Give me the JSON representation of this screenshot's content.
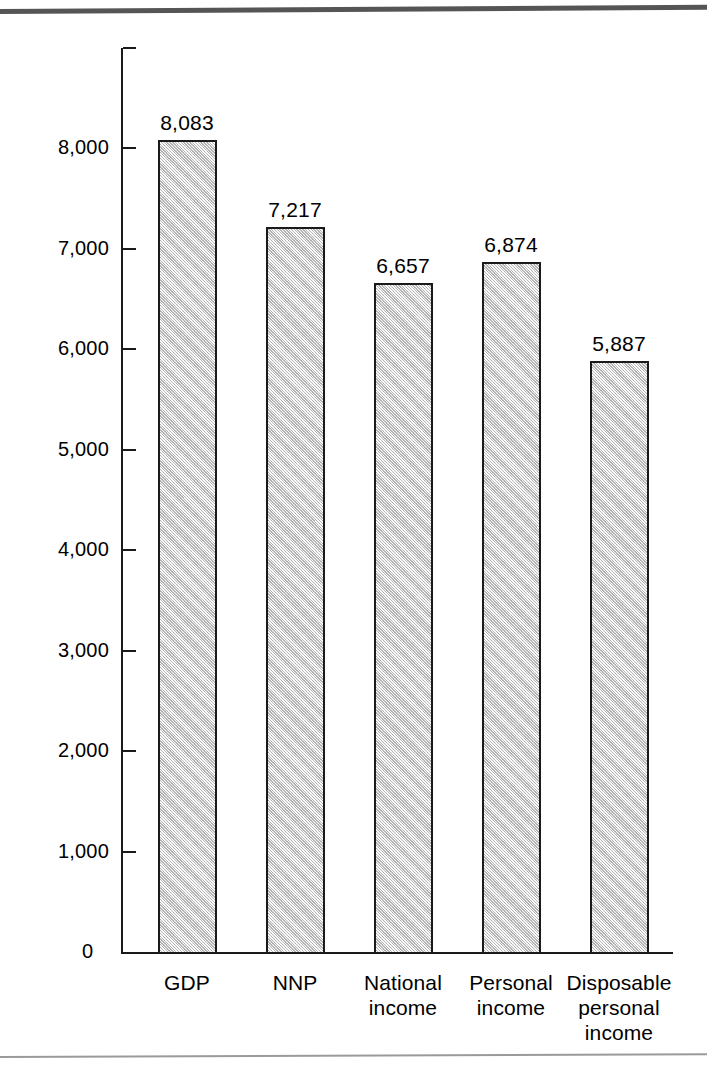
{
  "chart_data": {
    "type": "bar",
    "title": "",
    "subtitle": "",
    "xlabel": "",
    "ylabel": "",
    "categories": [
      "GDP",
      "National\nincome",
      "NNP",
      "Personal\nincome",
      "Disposable\npersonal\nincome"
    ],
    "category_lines": [
      [
        "GDP"
      ],
      [
        "NNP"
      ],
      [
        "National",
        "income"
      ],
      [
        "Personal",
        "income"
      ],
      [
        "Disposable",
        "personal",
        "income"
      ]
    ],
    "values": [
      8083,
      7217,
      6657,
      6874,
      5887
    ],
    "value_labels": [
      "8,083",
      "7,217",
      "6,657",
      "6,874",
      "5,887"
    ],
    "ylim": [
      0,
      9000
    ],
    "ytick_values": [
      1000,
      2000,
      3000,
      4000,
      5000,
      6000,
      7000,
      8000,
      9000
    ],
    "ytick_labels": [
      "1,000",
      "2,000",
      "3,000",
      "4,000",
      "5,000",
      "6,000",
      "7,000",
      "8,000",
      ""
    ],
    "zero_label": "0",
    "grid": false,
    "legend": null,
    "legend_position": "none",
    "bar_fill_color": "#dcdcdc",
    "bar_edge_color": "#1a1a1a",
    "axis_color": "#1a1a1a",
    "background_color": "#ffffff"
  },
  "decoration": {
    "top_rule_color": "#555555",
    "bottom_rule_color": "#9a9a9a"
  }
}
